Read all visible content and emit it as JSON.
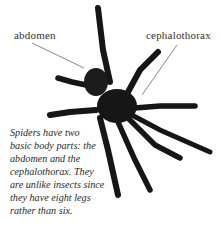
{
  "labels": {
    "abdomen": "abdomen",
    "cephalothorax": "cephalothorax"
  },
  "caption": {
    "lines": [
      "Spiders have two",
      "basic body parts: the",
      "abdomen and the",
      "cephalothorax. They",
      "are unlike insects since",
      "they have eight legs",
      "rather than six."
    ]
  },
  "colors": {
    "spider": "#141414",
    "leader_line": "#555555",
    "text": "#2a2a2a",
    "background": "#ffffff"
  },
  "figure": {
    "leg_count": 8
  }
}
